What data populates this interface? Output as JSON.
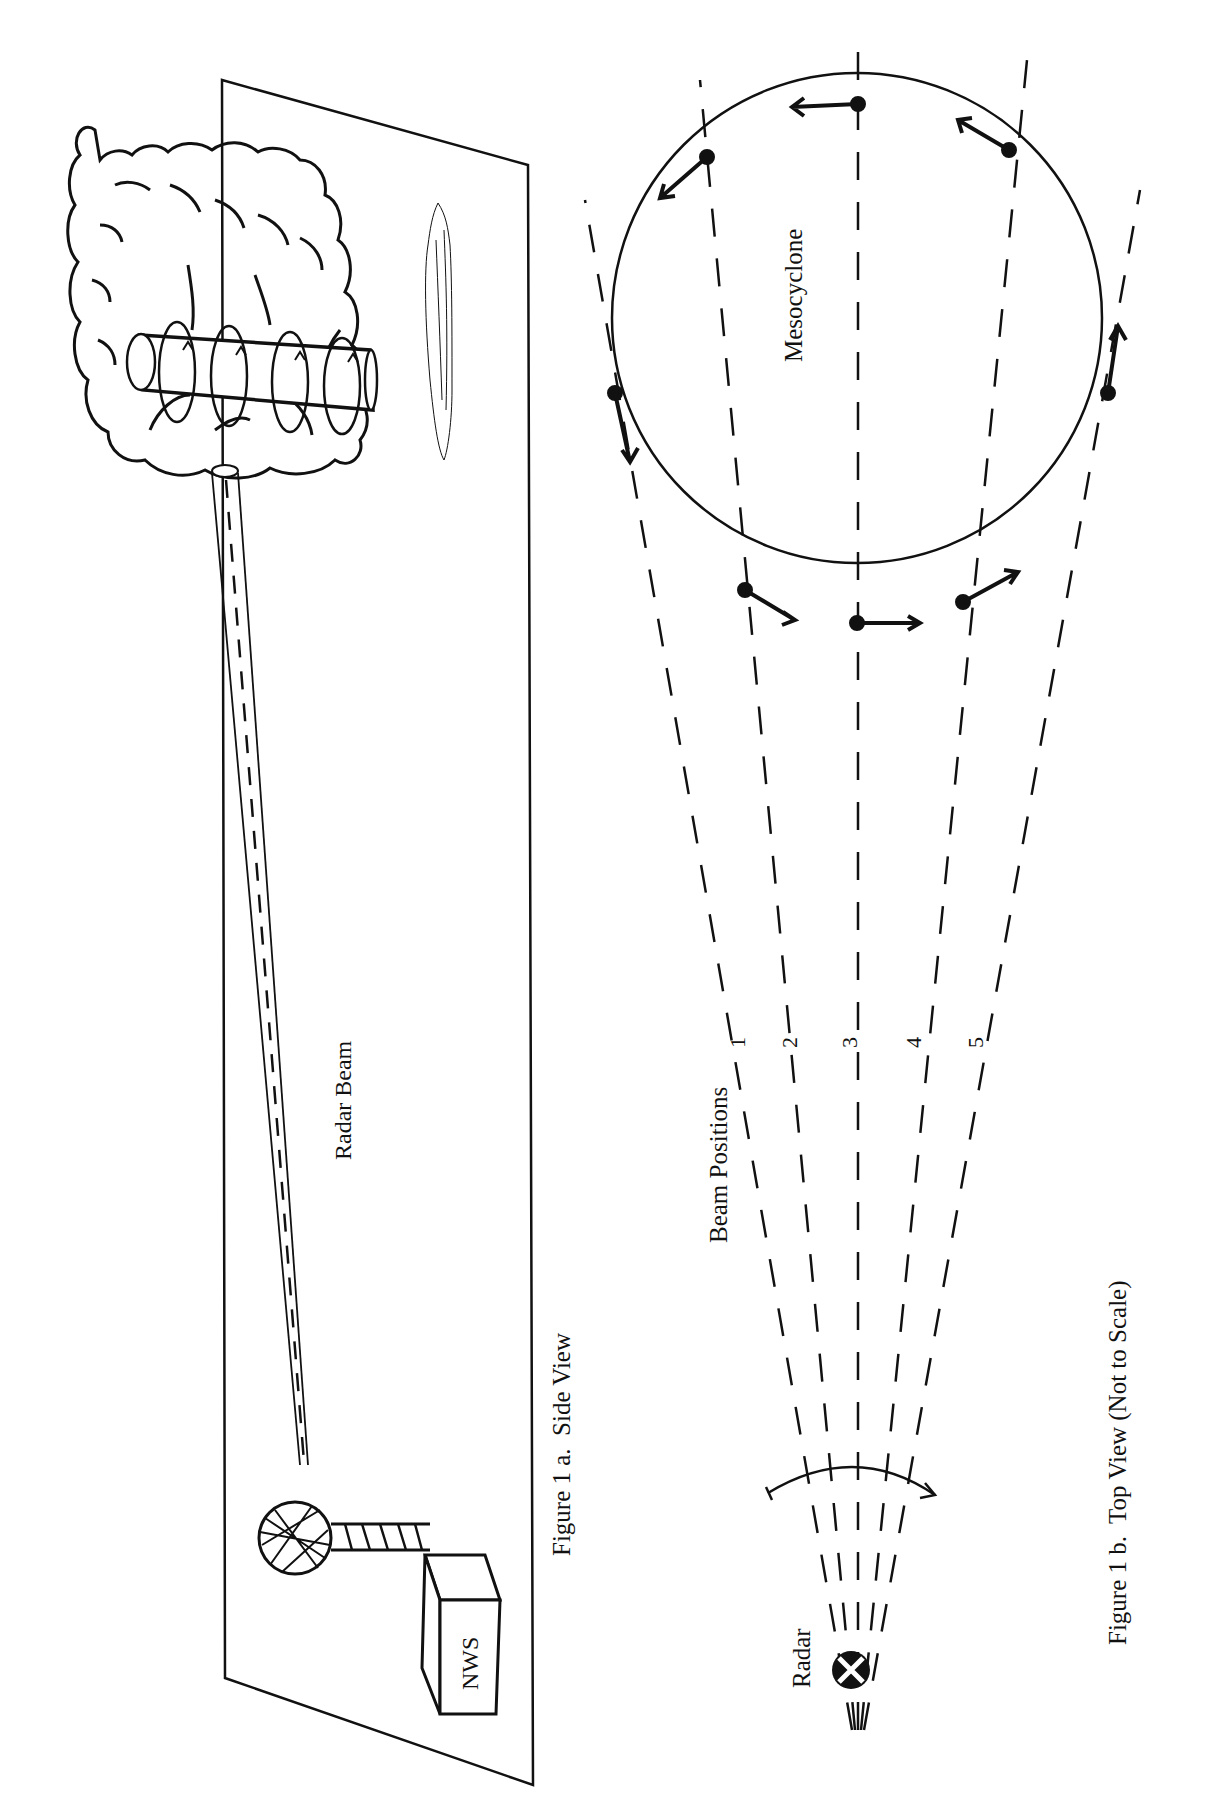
{
  "figure_a": {
    "caption": "Figure 1 a.  Side View",
    "beam_label": "Radar Beam",
    "station_label": "NWS",
    "elements": [
      "thunderstorm-cloud",
      "rotating-updraft-cylinder",
      "radar-beam-tube",
      "radar-dome",
      "nws-building",
      "ground-plane",
      "cloud-shadow"
    ]
  },
  "figure_b": {
    "caption": "Figure 1 b.  Top View (Not to Scale)",
    "mesocyclone_label": "Mesocyclone",
    "beam_positions_label": "Beam Positions",
    "radar_label": "Radar",
    "beam_numbers": [
      "1",
      "2",
      "3",
      "4",
      "5"
    ]
  },
  "colors": {
    "ink": "#111111",
    "paper": "#ffffff"
  }
}
